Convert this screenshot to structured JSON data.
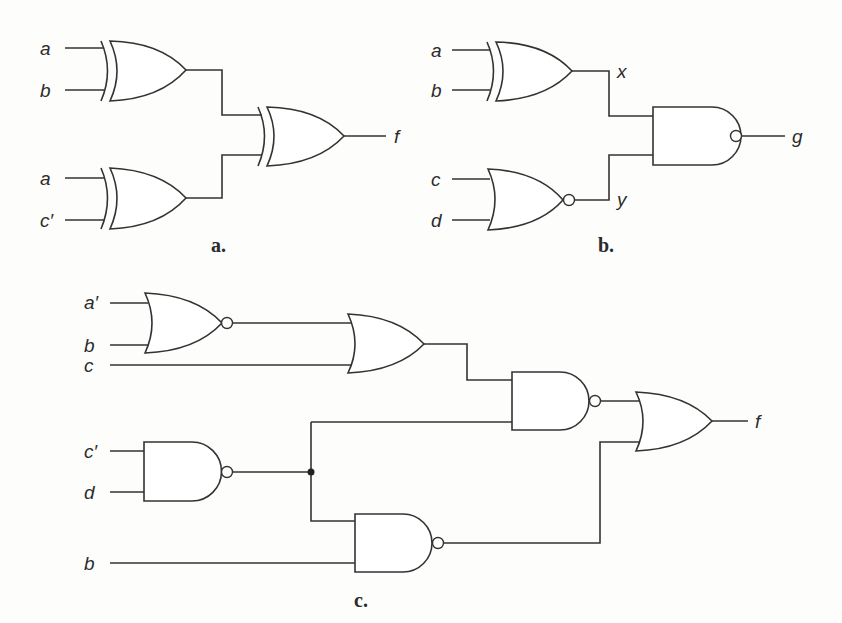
{
  "figure": {
    "parts": [
      {
        "caption": "a.",
        "inputs": [
          "a",
          "b",
          "a",
          "c′"
        ],
        "output": "f",
        "gates": [
          {
            "id": "a1",
            "type": "XOR",
            "inputs": [
              "a",
              "b"
            ]
          },
          {
            "id": "a2",
            "type": "XOR",
            "inputs": [
              "a",
              "c′"
            ]
          },
          {
            "id": "a3",
            "type": "XOR",
            "inputs": [
              "a1",
              "a2"
            ],
            "output": "f"
          }
        ]
      },
      {
        "caption": "b.",
        "inputs": [
          "a",
          "b",
          "c",
          "d"
        ],
        "intermediate": [
          "x",
          "y"
        ],
        "output": "g",
        "gates": [
          {
            "id": "b1",
            "type": "XOR",
            "inputs": [
              "a",
              "b"
            ],
            "output": "x"
          },
          {
            "id": "b2",
            "type": "NOR",
            "inputs": [
              "c",
              "d"
            ],
            "output": "y"
          },
          {
            "id": "b3",
            "type": "NAND",
            "inputs": [
              "x",
              "y"
            ],
            "output": "g"
          }
        ]
      },
      {
        "caption": "c.",
        "inputs": [
          "a′",
          "b",
          "c",
          "c′",
          "d",
          "b"
        ],
        "output": "f",
        "gates": [
          {
            "id": "c1",
            "type": "NOR",
            "inputs": [
              "a′",
              "b"
            ]
          },
          {
            "id": "c2",
            "type": "OR",
            "inputs": [
              "c1",
              "c"
            ]
          },
          {
            "id": "c3",
            "type": "NAND",
            "inputs": [
              "c′",
              "d"
            ]
          },
          {
            "id": "c4",
            "type": "NAND",
            "inputs": [
              "c2",
              "c3"
            ]
          },
          {
            "id": "c5",
            "type": "NAND",
            "inputs": [
              "c3",
              "b"
            ]
          },
          {
            "id": "c6",
            "type": "OR",
            "inputs": [
              "c4",
              "c5"
            ],
            "output": "f"
          }
        ]
      }
    ]
  }
}
